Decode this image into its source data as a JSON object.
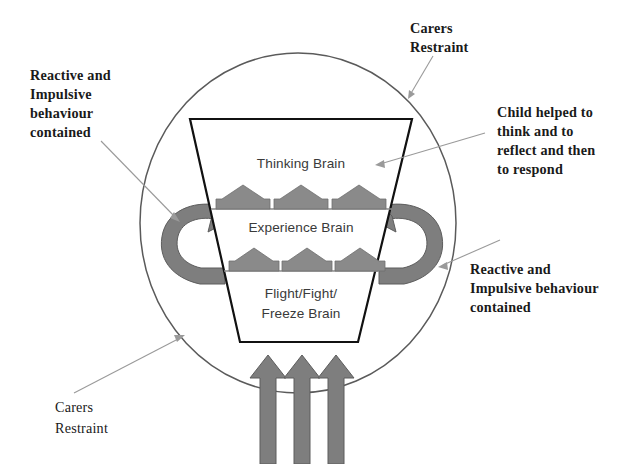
{
  "diagram": {
    "colors": {
      "outline": "#5a5a5a",
      "trapezoid_outline": "#111111",
      "arrow_fill": "#7e7e7e",
      "arrow_stroke": "#5d5d5d",
      "chevron_fill": "#8a8a8a",
      "leader_line": "#9a9a9a",
      "label_text": "#1a1a1a",
      "brain_label_text": "#3a3a3a",
      "background": "#ffffff"
    },
    "container": {
      "shape": "circle",
      "center_x": 298,
      "center_y": 223,
      "radius": 170
    },
    "brain_stack": {
      "shape": "trapezoid",
      "layers": [
        {
          "id": "thinking",
          "label": "Thinking Brain"
        },
        {
          "id": "experience",
          "label": "Experience Brain"
        },
        {
          "id": "flight-fight-freeze",
          "label_line_1": "Flight/Fight/",
          "label_line_2": "Freeze Brain"
        }
      ]
    },
    "annotations": [
      {
        "id": "carers-restraint-top",
        "lines": [
          "Carers",
          "Restraint"
        ],
        "position": "top-right"
      },
      {
        "id": "reactive-impulsive-left",
        "lines": [
          "Reactive and",
          "Impulsive",
          "behaviour",
          "contained"
        ],
        "position": "top-left"
      },
      {
        "id": "child-helped",
        "lines": [
          "Child helped to",
          "think and to",
          "reflect and then",
          "to respond"
        ],
        "position": "right"
      },
      {
        "id": "reactive-impulsive-right",
        "lines": [
          "Reactive and",
          "Impulsive behaviour",
          "contained"
        ],
        "position": "bottom-right"
      },
      {
        "id": "carers-restraint-bottom",
        "lines": [
          "Carers",
          "Restraint"
        ],
        "position": "bottom-left"
      }
    ],
    "flow_arrows": {
      "bottom_upward_count": 3,
      "recirculating_left": "curved-arrow-clockwise",
      "recirculating_right": "curved-arrow-anticlockwise",
      "chevron_rows": 2,
      "chevrons_per_row": 3
    }
  }
}
